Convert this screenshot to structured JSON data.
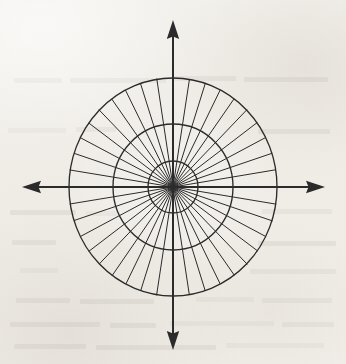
{
  "figure": {
    "caption": "",
    "medium": "scanned book page",
    "paper_color": "#f2f0ec",
    "ink_color": "#2b2b2b",
    "canvas": {
      "width": 346,
      "height": 364
    }
  },
  "chart_data": {
    "type": "polar-grid",
    "title": "",
    "xlabel": "",
    "ylabel": "",
    "grid": true,
    "legend": "none",
    "center": {
      "x": 173,
      "y": 187
    },
    "rings": [
      {
        "name": "inner-ring",
        "radius_x": 25,
        "radius_y": 26
      },
      {
        "name": "middle-ring",
        "radius_x": 60,
        "radius_y": 63
      },
      {
        "name": "outer-ring",
        "radius_x": 104,
        "radius_y": 109
      }
    ],
    "ring_count": 3,
    "spoke_count": 40,
    "spoke_step_degrees": 9,
    "spoke_angles_degrees": [
      0,
      9,
      18,
      27,
      36,
      45,
      54,
      63,
      72,
      81,
      90,
      99,
      108,
      117,
      126,
      135,
      144,
      153,
      162,
      171,
      180,
      189,
      198,
      207,
      216,
      225,
      234,
      243,
      252,
      261,
      270,
      279,
      288,
      297,
      306,
      315,
      324,
      333,
      342,
      351
    ],
    "axes": [
      {
        "name": "y-axis-positive",
        "direction": "up",
        "tip_x": 173,
        "tip_y": 20,
        "arrowhead": true
      },
      {
        "name": "y-axis-negative",
        "direction": "down",
        "tip_x": 173,
        "tip_y": 350,
        "arrowhead": true
      },
      {
        "name": "x-axis-negative",
        "direction": "left",
        "tip_x": 22,
        "tip_y": 187,
        "arrowhead": true
      },
      {
        "name": "x-axis-positive",
        "direction": "right",
        "tip_x": 325,
        "tip_y": 187,
        "arrowhead": true
      }
    ],
    "annotations": [],
    "tick_labels": []
  },
  "bleed_through_marks": [
    {
      "x": 14,
      "y": 78,
      "w": 48
    },
    {
      "x": 70,
      "y": 78,
      "w": 96
    },
    {
      "x": 174,
      "y": 76,
      "w": 62
    },
    {
      "x": 244,
      "y": 77,
      "w": 84
    },
    {
      "x": 8,
      "y": 128,
      "w": 58
    },
    {
      "x": 76,
      "y": 127,
      "w": 40
    },
    {
      "x": 258,
      "y": 129,
      "w": 72
    },
    {
      "x": 10,
      "y": 210,
      "w": 66
    },
    {
      "x": 86,
      "y": 211,
      "w": 34
    },
    {
      "x": 262,
      "y": 209,
      "w": 70
    },
    {
      "x": 12,
      "y": 240,
      "w": 44
    },
    {
      "x": 258,
      "y": 241,
      "w": 78
    },
    {
      "x": 20,
      "y": 268,
      "w": 38
    },
    {
      "x": 250,
      "y": 269,
      "w": 86
    },
    {
      "x": 16,
      "y": 298,
      "w": 54
    },
    {
      "x": 80,
      "y": 299,
      "w": 74
    },
    {
      "x": 196,
      "y": 297,
      "w": 58
    },
    {
      "x": 262,
      "y": 298,
      "w": 70
    },
    {
      "x": 10,
      "y": 322,
      "w": 90
    },
    {
      "x": 110,
      "y": 323,
      "w": 46
    },
    {
      "x": 170,
      "y": 321,
      "w": 104
    },
    {
      "x": 282,
      "y": 322,
      "w": 52
    },
    {
      "x": 14,
      "y": 344,
      "w": 72
    },
    {
      "x": 96,
      "y": 345,
      "w": 120
    },
    {
      "x": 226,
      "y": 343,
      "w": 98
    }
  ]
}
